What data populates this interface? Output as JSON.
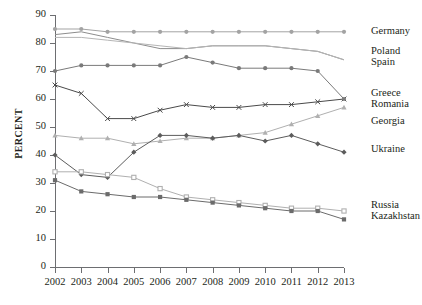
{
  "chart_data": {
    "type": "line",
    "title": "",
    "xlabel": "",
    "ylabel": "PERCENT",
    "grid": false,
    "legend_position": "right-endpoints",
    "x": [
      2002,
      2003,
      2004,
      2005,
      2006,
      2007,
      2008,
      2009,
      2010,
      2011,
      2012,
      2013
    ],
    "xticklabels": [
      "2002",
      "2003",
      "2004",
      "2005",
      "2006",
      "2007",
      "2008",
      "2009",
      "2010",
      "2011",
      "2012",
      "2013"
    ],
    "yticklabels": [
      "0",
      "10",
      "20",
      "30",
      "40",
      "50",
      "60",
      "70",
      "80",
      "90"
    ],
    "yticks": [
      0,
      10,
      20,
      30,
      40,
      50,
      60,
      70,
      80,
      90
    ],
    "ylim": [
      0,
      90
    ],
    "series": [
      {
        "name": "Germany",
        "marker": "circle",
        "color": "#a3a3a3",
        "values": [
          85,
          85,
          84,
          84,
          84,
          84,
          84,
          84,
          84,
          84,
          84,
          84
        ]
      },
      {
        "name": "Poland",
        "marker": "none",
        "color": "#8d8d8d",
        "values": [
          83,
          84,
          82,
          80,
          78,
          78,
          79,
          79,
          79,
          78,
          77,
          74
        ]
      },
      {
        "name": "Spain",
        "marker": "none",
        "color": "#b5b5b5",
        "values": [
          82,
          82,
          81,
          80,
          79,
          78,
          79,
          79,
          79,
          78,
          77,
          74
        ]
      },
      {
        "name": "Greece",
        "marker": "x",
        "color": "#4a4a4a",
        "values": [
          65,
          62,
          53,
          53,
          56,
          58,
          57,
          57,
          58,
          58,
          59,
          60
        ]
      },
      {
        "name": "Romania",
        "marker": "circle",
        "color": "#7a7a7a",
        "values": [
          70,
          72,
          72,
          72,
          72,
          75,
          73,
          71,
          71,
          71,
          70,
          60
        ]
      },
      {
        "name": "Georgia",
        "marker": "triangle",
        "color": "#b0b0b0",
        "values": [
          47,
          46,
          46,
          44,
          45,
          46,
          46,
          47,
          48,
          51,
          54,
          57
        ]
      },
      {
        "name": "Ukraine",
        "marker": "diamond",
        "color": "#5c5c5c",
        "values": [
          40,
          33,
          32,
          41,
          47,
          47,
          46,
          47,
          45,
          47,
          44,
          41
        ]
      },
      {
        "name": "Russia",
        "marker": "square-open",
        "color": "#b0b0b0",
        "values": [
          34,
          34,
          33,
          32,
          28,
          25,
          24,
          23,
          22,
          21,
          21,
          20
        ]
      },
      {
        "name": "Kazakhstan",
        "marker": "square-filled",
        "color": "#6b6b6b",
        "values": [
          31,
          27,
          26,
          25,
          25,
          24,
          23,
          22,
          21,
          20,
          20,
          17
        ]
      }
    ],
    "legend_groups": [
      {
        "labels": [
          "Germany"
        ],
        "anchor_value": 84
      },
      {
        "labels": [
          "Poland",
          "Spain"
        ],
        "anchor_value": 75
      },
      {
        "labels": [
          "Greece",
          "Romania"
        ],
        "anchor_value": 60
      },
      {
        "labels": [
          "Georgia"
        ],
        "anchor_value": 52
      },
      {
        "labels": [
          "Ukraine"
        ],
        "anchor_value": 42
      },
      {
        "labels": [
          "Russia",
          "Kazakhstan"
        ],
        "anchor_value": 20
      }
    ]
  }
}
